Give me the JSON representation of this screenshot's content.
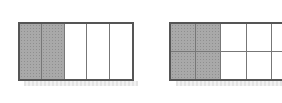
{
  "figures": [
    {
      "id": "left",
      "rows": 1,
      "cols": 5,
      "shaded_cols": 2,
      "fraction_shaded": "2/5"
    },
    {
      "id": "right",
      "rows": 2,
      "cols": 5,
      "visible_cols": 5,
      "shaded_cols": 2,
      "fraction_shaded": "4/10",
      "note_cropped_right_edge": true
    }
  ],
  "colors": {
    "border": "#555555",
    "divider": "#777777",
    "shaded": "#a9a9a9",
    "background": "#ffffff"
  }
}
